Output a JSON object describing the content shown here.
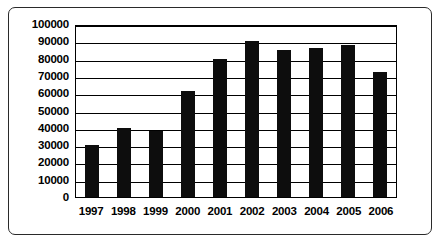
{
  "chart_data": {
    "type": "bar",
    "title": "",
    "subtitle": "",
    "xlabel": "",
    "ylabel": "",
    "categories": [
      "1997",
      "1998",
      "1999",
      "2000",
      "2001",
      "2002",
      "2003",
      "2004",
      "2005",
      "2006"
    ],
    "values": [
      30000,
      40000,
      38000,
      61000,
      80000,
      90000,
      85000,
      86000,
      88000,
      72000
    ],
    "series": [
      {
        "name": "",
        "values": [
          30000,
          40000,
          38000,
          61000,
          80000,
          90000,
          85000,
          86000,
          88000,
          72000
        ]
      }
    ],
    "ylim": [
      0,
      100000
    ],
    "ytick_labels": [
      "100000",
      "90000",
      "80000",
      "70000",
      "60000",
      "50000",
      "40000",
      "30000",
      "20000",
      "10000",
      "0"
    ],
    "ytick_values": [
      100000,
      90000,
      80000,
      70000,
      60000,
      50000,
      40000,
      30000,
      20000,
      10000,
      0
    ],
    "ytick_interval": 10000,
    "grid": true,
    "grid_axis": "y",
    "legend": false,
    "legend_position": "none",
    "bar_color": "#0d0d0d",
    "grid_color": "#000000",
    "axis_color": "#000000",
    "background_color": "#ffffff",
    "frame_color": "#2a2a2a",
    "annotations": []
  }
}
